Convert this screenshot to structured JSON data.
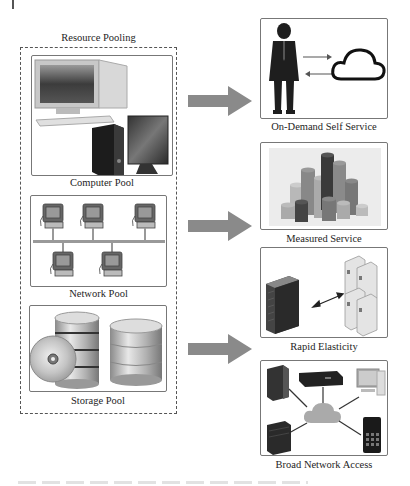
{
  "figure": {
    "resource_pooling": {
      "title": "Resource Pooling",
      "pools": [
        {
          "label": "Computer Pool",
          "icon": "desktop-computers-icon"
        },
        {
          "label": "Network Pool",
          "icon": "networked-terminals-icon"
        },
        {
          "label": "Storage Pool",
          "icon": "database-disk-icon"
        }
      ]
    },
    "characteristics": [
      {
        "label": "On-Demand Self Service",
        "icon": "person-cloud-icon"
      },
      {
        "label": "Measured Service",
        "icon": "cylinder-bars-icon"
      },
      {
        "label": "Rapid Elasticity",
        "icon": "server-scaling-icon"
      },
      {
        "label": "Broad Network Access",
        "icon": "devices-cloud-icon"
      }
    ],
    "arrow_color": "#8a8a8a",
    "border_color": "#555555",
    "caption": ""
  }
}
